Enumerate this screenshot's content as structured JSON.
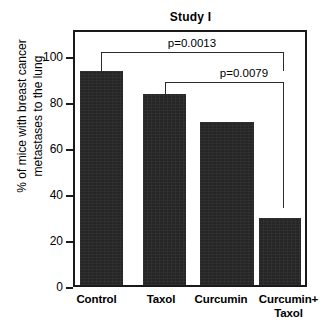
{
  "chart_data": {
    "type": "bar",
    "title": "Study I",
    "xlabel": "",
    "ylabel": "% of mice with breast cancer metastases to the lung",
    "ylabel_lines": [
      "% of mice with breast cancer",
      "metastases to the lung"
    ],
    "categories": [
      "Control",
      "Taxol",
      "Curcumin",
      "Curcumin+ Taxol"
    ],
    "category_lines": [
      [
        "Control"
      ],
      [
        "Taxol"
      ],
      [
        "Curcumin"
      ],
      [
        "Curcumin+",
        "Taxol"
      ]
    ],
    "values": [
      93,
      83,
      71,
      29
    ],
    "ylim": [
      0,
      100
    ],
    "yticks": [
      0,
      20,
      40,
      60,
      80,
      100
    ],
    "ytick_labels": [
      "0",
      "20",
      "40",
      "60",
      "80",
      "100"
    ],
    "grid": false,
    "legend": null,
    "bar_color": "#262626",
    "axis_color": "#1a1a1a",
    "annotations": [
      {
        "name": "p-value-control-vs-curcumin-taxol",
        "label": "p=0.0013",
        "from_category": "Control",
        "to_category": "Curcumin+ Taxol"
      },
      {
        "name": "p-value-taxol-vs-curcumin-taxol",
        "label": "p=0.0079",
        "from_category": "Taxol",
        "to_category": "Curcumin+ Taxol"
      }
    ]
  }
}
